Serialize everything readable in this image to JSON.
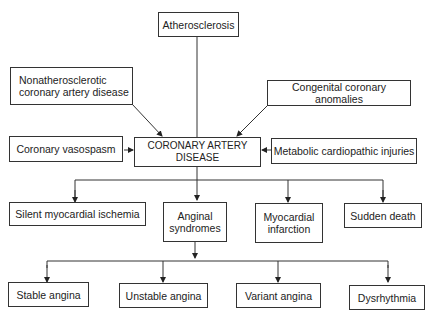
{
  "nodes": {
    "atherosclerosis": "Atherosclerosis",
    "nonathero": "Nonatherosclerotic coronary artery disease",
    "congenital": "Congenital coronary anomalies",
    "vasospasm": "Coronary vasospasm",
    "cad": "CORONARY ARTERY DISEASE",
    "metabolic": "Metabolic cardiopathic injuries",
    "silent": "Silent myocardial ischemia",
    "anginal": "Anginal syndromes",
    "mi": "Myocardial infarction",
    "sudden": "Sudden death",
    "stable": "Stable angina",
    "unstable": "Unstable angina",
    "variant": "Variant angina",
    "dysrhythmia": "Dysrhythmia"
  }
}
